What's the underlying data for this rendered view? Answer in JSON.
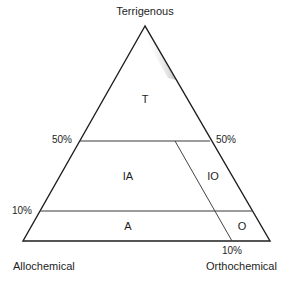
{
  "diagram": {
    "type": "ternary",
    "vertices": {
      "top": "Terrigenous",
      "bottom_left": "Allochemical",
      "bottom_right": "Orthochemical"
    },
    "percent_labels": {
      "left_50": "50%",
      "right_50": "50%",
      "left_10": "10%",
      "bottom_10": "10%"
    },
    "fields": {
      "T": "T",
      "IA": "IA",
      "IO": "IO",
      "A": "A",
      "O": "O"
    },
    "colors": {
      "line": "#1e1e1e",
      "divider": "#555555",
      "shading": "#9a9a9a",
      "background": "#ffffff"
    }
  }
}
